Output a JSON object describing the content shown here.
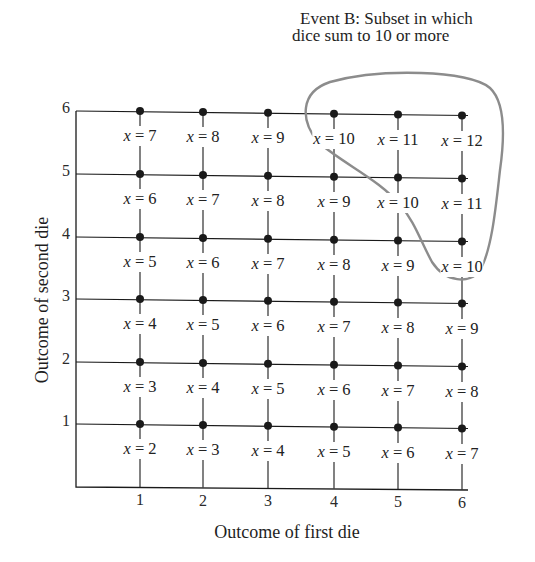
{
  "annotation": {
    "line1": "Event  B: Subset in which",
    "line2": "dice sum to 10  or more"
  },
  "axes": {
    "xlabel": "Outcome of first die",
    "ylabel": "Outcome of second die",
    "xticks": [
      "1",
      "2",
      "3",
      "4",
      "5",
      "6"
    ],
    "yticks": [
      "1",
      "2",
      "3",
      "4",
      "5",
      "6"
    ]
  },
  "colors": {
    "ink": "#1a1a1a",
    "event_outline": "#8c8c8c",
    "background": "#ffffff"
  },
  "variable": "x",
  "chart_data": {
    "type": "table",
    "xlabel": "Outcome of first die",
    "ylabel": "Outcome of second die",
    "x": [
      1,
      2,
      3,
      4,
      5,
      6
    ],
    "y": [
      1,
      2,
      3,
      4,
      5,
      6
    ],
    "grid": true,
    "rows": [
      {
        "second_die": 6,
        "sums": [
          7,
          8,
          9,
          10,
          11,
          12
        ]
      },
      {
        "second_die": 5,
        "sums": [
          6,
          7,
          8,
          9,
          10,
          11
        ]
      },
      {
        "second_die": 4,
        "sums": [
          5,
          6,
          7,
          8,
          9,
          10
        ]
      },
      {
        "second_die": 3,
        "sums": [
          4,
          5,
          6,
          7,
          8,
          9
        ]
      },
      {
        "second_die": 2,
        "sums": [
          3,
          4,
          5,
          6,
          7,
          8
        ]
      },
      {
        "second_die": 1,
        "sums": [
          2,
          3,
          4,
          5,
          6,
          7
        ]
      }
    ],
    "annotations": [
      {
        "text": "Event B: Subset in which dice sum to 10 or more",
        "encloses": [
          [
            4,
            6
          ],
          [
            5,
            6
          ],
          [
            6,
            6
          ],
          [
            5,
            5
          ],
          [
            6,
            5
          ],
          [
            6,
            4
          ]
        ]
      }
    ]
  }
}
